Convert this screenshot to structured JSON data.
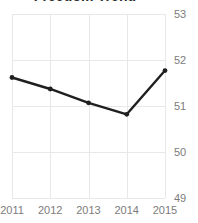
{
  "chart_data": {
    "type": "line",
    "title": "Freedom Trend",
    "xlabel": "",
    "ylabel": "",
    "categories": [
      "2011",
      "2012",
      "2013",
      "2014",
      "2015"
    ],
    "x": [
      2011,
      2012,
      2013,
      2014,
      2015
    ],
    "series": [
      {
        "name": "Freedom score",
        "values": [
          51.62,
          51.37,
          51.07,
          50.82,
          51.77
        ],
        "color": "#1f1f1f",
        "marker": "circle",
        "line_width": 2.4
      }
    ],
    "ylim": [
      49,
      53
    ],
    "xlim": [
      2011,
      2015
    ],
    "y_ticks": [
      53,
      52,
      51,
      50,
      49
    ],
    "y_tick_labels": [
      "53",
      "52",
      "51",
      "50",
      "49"
    ],
    "x_ticks": [
      2011,
      2012,
      2013,
      2014,
      2015
    ],
    "x_tick_labels": [
      "2011",
      "2012",
      "2013",
      "2014",
      "2015"
    ],
    "grid": true,
    "grid_color": "#e8e8e8",
    "legend": false,
    "legend_position": "none",
    "y_axis_side": "right",
    "tick_label_color": "#7c7c7c",
    "background_color": "#ffffff",
    "annotations": []
  },
  "axes": {
    "y_labels": [
      "53",
      "52",
      "51",
      "50",
      "49"
    ],
    "x_labels": [
      "2011",
      "2012",
      "2013",
      "2014",
      "2015"
    ]
  }
}
